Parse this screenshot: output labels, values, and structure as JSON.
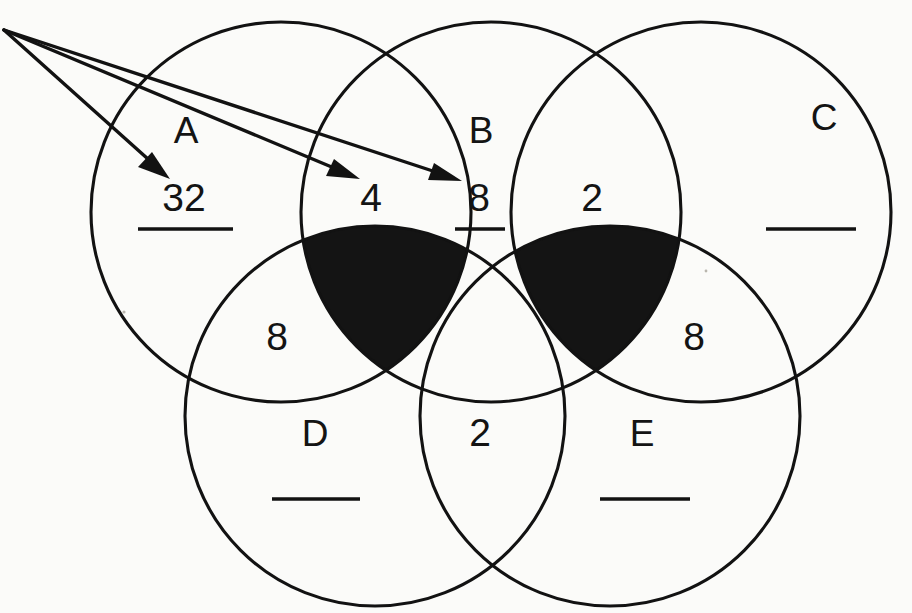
{
  "diagram": {
    "type": "venn-diagram-worksheet",
    "background_color": "#fbfbf9",
    "ink_color": "#141414",
    "shaded_fill": "#141414",
    "circles": [
      {
        "id": "A",
        "label": "A",
        "cx": 281,
        "cy": 212,
        "r": 190
      },
      {
        "id": "B",
        "label": "B",
        "cx": 491,
        "cy": 212,
        "r": 190
      },
      {
        "id": "C",
        "label": "C",
        "cx": 701,
        "cy": 212,
        "r": 190
      },
      {
        "id": "D",
        "label": "D",
        "cx": 375,
        "cy": 416,
        "r": 190
      },
      {
        "id": "E",
        "label": "E",
        "cx": 610,
        "cy": 416,
        "r": 190
      }
    ],
    "set_labels": [
      {
        "name": "set-label-a",
        "text": "A",
        "x": 186,
        "y": 143
      },
      {
        "name": "set-label-b",
        "text": "B",
        "x": 481,
        "y": 143
      },
      {
        "name": "set-label-c",
        "text": "C",
        "x": 824,
        "y": 130
      },
      {
        "name": "set-label-d",
        "text": "D",
        "x": 315,
        "y": 446
      },
      {
        "name": "set-label-e",
        "text": "E",
        "x": 642,
        "y": 446
      }
    ],
    "region_values": [
      {
        "name": "region-value-a-only",
        "text": "32",
        "x": 184,
        "y": 211,
        "underlined": true,
        "underline": {
          "x1": 138,
          "x2": 233,
          "y": 229
        }
      },
      {
        "name": "region-value-a-b",
        "text": "4",
        "x": 371,
        "y": 211,
        "underlined": false
      },
      {
        "name": "region-value-b-only-left",
        "text": "8",
        "x": 479,
        "y": 211,
        "underlined": true,
        "underline": {
          "x1": 455,
          "x2": 505,
          "y": 229
        }
      },
      {
        "name": "region-value-b-c",
        "text": "2",
        "x": 592,
        "y": 211,
        "underlined": false
      },
      {
        "name": "region-value-a-d",
        "text": "8",
        "x": 277,
        "y": 350,
        "underlined": false
      },
      {
        "name": "region-value-c-e",
        "text": "8",
        "x": 694,
        "y": 350,
        "underlined": false
      },
      {
        "name": "region-value-d-e",
        "text": "2",
        "x": 480,
        "y": 446,
        "underlined": false
      }
    ],
    "answer_blanks": [
      {
        "name": "answer-blank-c",
        "x1": 766,
        "x2": 856,
        "y": 229
      },
      {
        "name": "answer-blank-d",
        "x1": 272,
        "x2": 360,
        "y": 499
      },
      {
        "name": "answer-blank-e",
        "x1": 600,
        "x2": 690,
        "y": 499
      }
    ],
    "arrows": {
      "name": "callout-arrows",
      "origin": {
        "x": 4,
        "y": 30
      },
      "targets": [
        {
          "name": "arrow-to-32",
          "x": 168,
          "y": 177,
          "points_to": "32"
        },
        {
          "name": "arrow-to-4",
          "x": 358,
          "y": 179,
          "points_to": "4"
        },
        {
          "name": "arrow-to-8",
          "x": 459,
          "y": 181,
          "points_to": "8"
        }
      ]
    },
    "shaded_regions": [
      {
        "name": "shaded-region-abd",
        "description": "intersection of circles A, B and D"
      },
      {
        "name": "shaded-region-bce",
        "description": "intersection of circles B, C and E"
      }
    ]
  }
}
